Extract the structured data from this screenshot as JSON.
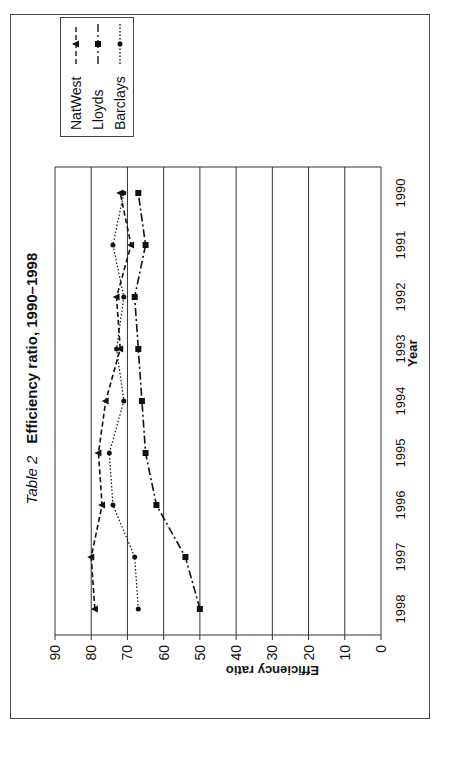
{
  "chart_data": {
    "type": "line",
    "title_prefix": "Table 2",
    "title": "Efficiency ratio, 1990–1998",
    "xlabel": "Year",
    "ylabel": "Efficiency ratio",
    "categories": [
      "1998",
      "1997",
      "1996",
      "1995",
      "1994",
      "1993",
      "1992",
      "1991",
      "1990"
    ],
    "ylim": [
      0,
      90
    ],
    "yticks": [
      "0",
      "10",
      "20",
      "30",
      "40",
      "50",
      "60",
      "70",
      "80",
      "90"
    ],
    "grid": true,
    "legend_position": "upper right",
    "orientation_note": "figure rendered rotated 90 degrees on page",
    "series": [
      {
        "name": "NatWest",
        "style": "dashed",
        "marker": "triangle",
        "values": [
          79,
          80,
          77,
          78,
          76,
          72,
          73,
          69,
          72
        ]
      },
      {
        "name": "Lloyds",
        "style": "dash-dot",
        "marker": "square",
        "values": [
          50,
          54,
          62,
          65,
          66,
          67,
          68,
          65,
          67
        ]
      },
      {
        "name": "Barclays",
        "style": "dotted",
        "marker": "circle",
        "values": [
          67,
          68,
          74,
          75,
          71,
          73,
          71,
          74,
          71
        ]
      }
    ]
  }
}
